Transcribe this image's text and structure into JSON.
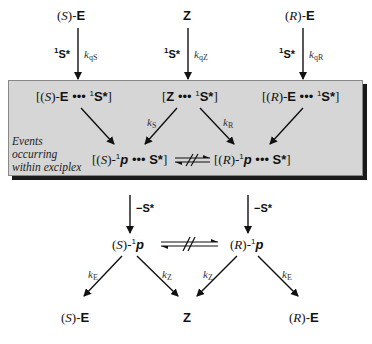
{
  "top_row": {
    "s_e": {
      "config": "S",
      "name": "E"
    },
    "z": {
      "name": "Z"
    },
    "r_e": {
      "config": "R",
      "name": "E"
    }
  },
  "quench_arrows": [
    {
      "reagent": "S*",
      "reagent_sup": "1",
      "k": "k",
      "k_sub": "qS"
    },
    {
      "reagent": "S*",
      "reagent_sup": "1",
      "k": "k",
      "k_sub": "qZ"
    },
    {
      "reagent": "S*",
      "reagent_sup": "1",
      "k": "k",
      "k_sub": "qR"
    }
  ],
  "exciplex_box": {
    "label_lines": [
      "Events",
      "occurring",
      "within exciplex"
    ],
    "exciplexes": [
      {
        "open": "[(",
        "config": "S",
        "mid": ")-",
        "name": "E",
        "dots": "•••",
        "sup": "1",
        "partner": "S*",
        "close": "]"
      },
      {
        "open": "[",
        "name": "Z",
        "dots": "•••",
        "sup": "1",
        "partner": "S*",
        "close": "]"
      },
      {
        "open": "[(",
        "config": "R",
        "mid": ")-",
        "name": "E",
        "dots": "•••",
        "sup": "1",
        "partner": "S*",
        "close": "]"
      }
    ],
    "rates": [
      {
        "k": "k",
        "sub": "S"
      },
      {
        "k": "k",
        "sub": "R"
      }
    ],
    "pair_exciplexes": [
      {
        "open": "[(",
        "config": "S",
        "mid": ")-",
        "sup": "1",
        "name": "p",
        "dots": "•••",
        "partner": "S*",
        "close": "]"
      },
      {
        "open": "[(",
        "config": "R",
        "mid": ")-",
        "sup": "1",
        "name": "p",
        "dots": "•••",
        "partner": "S*",
        "close": "]"
      }
    ]
  },
  "release": [
    {
      "label": "−S*"
    },
    {
      "label": "−S*"
    }
  ],
  "free_pairs": [
    {
      "open": "(",
      "config": "S",
      "mid": ")-",
      "sup": "1",
      "name": "p"
    },
    {
      "open": "(",
      "config": "R",
      "mid": ")-",
      "sup": "1",
      "name": "p"
    }
  ],
  "decay_rates": [
    {
      "k": "k",
      "sub": "E"
    },
    {
      "k": "k",
      "sub": "Z"
    },
    {
      "k": "k",
      "sub": "Z"
    },
    {
      "k": "k",
      "sub": "E"
    }
  ],
  "products": [
    {
      "config": "S",
      "name": "E"
    },
    {
      "name": "Z"
    },
    {
      "config": "R",
      "name": "E"
    }
  ]
}
